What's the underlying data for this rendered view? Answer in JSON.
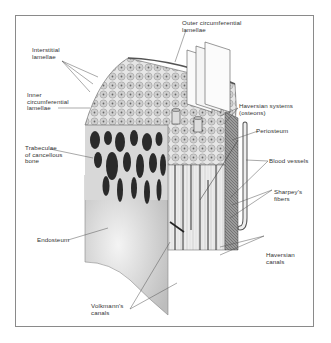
{
  "figure": {
    "labels": {
      "outer_circumferential_lamellae": "Outer circumferential\nlamellae",
      "interstitial_lamellae": "Interstitial\nlamellae",
      "inner_circumferential_lamellae": "Inner\ncircumferential\nlamellae",
      "haversian_systems": "Haversian systems\n(osteons)",
      "periosteum": "Periosteum",
      "trabeculae": "Trabeculae\nof cancellous\nbone",
      "blood_vessels": "Blood vessels",
      "sharpeys_fibers": "Sharpey's\nfibers",
      "endosteum": "Endosteum",
      "haversian_canals": "Haversian\ncanals",
      "volkmanns_canals": "Volkmann's\ncanals"
    }
  }
}
